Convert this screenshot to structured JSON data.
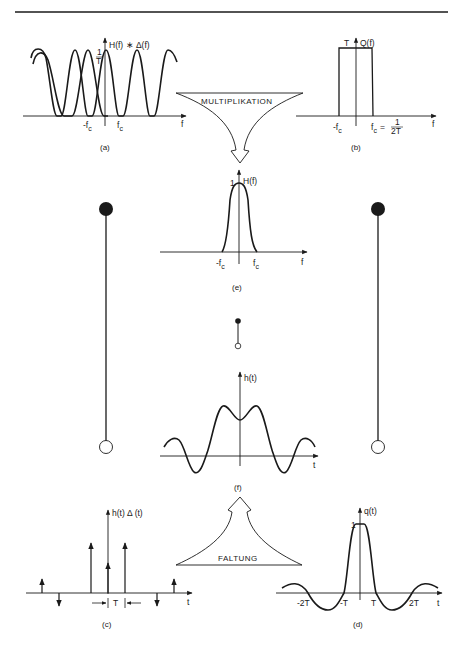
{
  "page": {
    "header_rule": true,
    "page_number": ""
  },
  "panels": {
    "a": {
      "caption": "(a)",
      "ylabel": "H(f) ∗ Δ(f)",
      "peak_label_num": "1",
      "peak_label_den": "T",
      "tick_neg": "-f",
      "tick_pos": "f",
      "tick_sub": "c",
      "xlabel": "f"
    },
    "b": {
      "caption": "(b)",
      "ylabel": "Q(f)",
      "height_label": "T",
      "tick_neg": "-f",
      "tick_pos": "f",
      "tick_sub": "c",
      "eq": "=",
      "frac_num": "1",
      "frac_den": "2T",
      "xlabel": "f"
    },
    "e": {
      "caption": "(e)",
      "ylabel": "H(f)",
      "peak_label": "1",
      "tick_neg": "-f",
      "tick_pos": "f",
      "tick_sub": "c",
      "xlabel": "f"
    },
    "f": {
      "caption": "(f)",
      "ylabel": "h(t)",
      "xlabel": "t"
    },
    "c": {
      "caption": "(c)",
      "ylabel": "h(t) Δ (t)",
      "spacing_label": "T",
      "xlabel": "t"
    },
    "d": {
      "caption": "(d)",
      "ylabel": "q(t)",
      "peak_label": "1",
      "ticks": [
        "-2T",
        "-T",
        "T",
        "2T"
      ],
      "xlabel": "t"
    }
  },
  "arrows": {
    "multiply": {
      "label": "MULTIPLIKATION"
    },
    "convolve": {
      "label": "FALTUNG"
    }
  },
  "pendulums": {
    "left": {
      "top": "filled-circle",
      "bottom": "open-circle"
    },
    "center": {
      "top": "filled-circle",
      "bottom": "open-circle"
    },
    "right": {
      "top": "filled-circle",
      "bottom": "open-circle"
    }
  }
}
